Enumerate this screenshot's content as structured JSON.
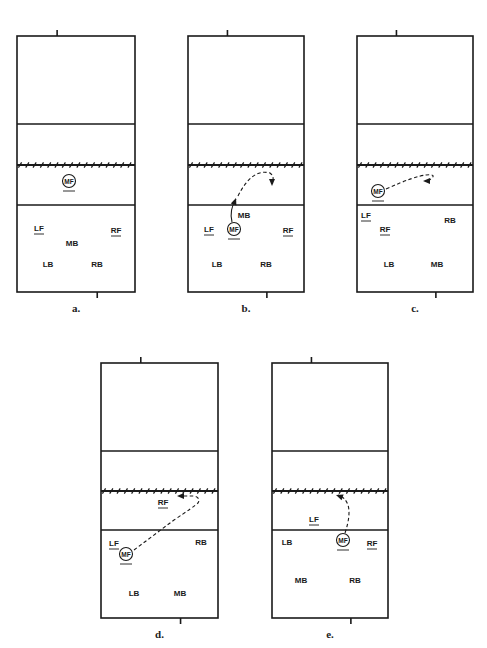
{
  "figure": {
    "ink_color": "#1a1a1a",
    "panels": [
      {
        "id": "a",
        "caption": "a.",
        "court": {
          "x": 17,
          "top": 36,
          "w": 118,
          "h": 256,
          "back_line_y": 124,
          "net_y": 165,
          "attack_line_y": 205
        },
        "players": [
          {
            "label": "MF",
            "x": 69,
            "y": 181,
            "circled": true,
            "underline": true
          },
          {
            "label": "LF",
            "x": 39,
            "y": 228,
            "underline": true
          },
          {
            "label": "MB",
            "x": 72,
            "y": 243
          },
          {
            "label": "RF",
            "x": 116,
            "y": 230,
            "underline": true
          },
          {
            "label": "LB",
            "x": 48,
            "y": 264
          },
          {
            "label": "RB",
            "x": 97,
            "y": 264
          }
        ],
        "paths": []
      },
      {
        "id": "b",
        "caption": "b.",
        "court": {
          "x": 188,
          "top": 36,
          "w": 116,
          "h": 256,
          "back_line_y": 124,
          "net_y": 165,
          "attack_line_y": 205
        },
        "players": [
          {
            "label": "MB",
            "x": 244,
            "y": 215
          },
          {
            "label": "LF",
            "x": 209,
            "y": 229,
            "underline": true
          },
          {
            "label": "MF",
            "x": 234,
            "y": 229,
            "circled": true,
            "underline": true
          },
          {
            "label": "RF",
            "x": 288,
            "y": 230,
            "underline": true
          },
          {
            "label": "LB",
            "x": 217,
            "y": 264
          },
          {
            "label": "RB",
            "x": 266,
            "y": 264
          }
        ],
        "paths": [
          {
            "style": "solid",
            "d": "M232 222 Q229 210 236 199",
            "arrow": {
              "x": 236,
              "y": 198,
              "angle": -70
            }
          },
          {
            "style": "dashed",
            "d": "M238 196 Q252 168 270 173 Q275 177 272 182",
            "arrow": {
              "x": 272,
              "y": 186,
              "angle": 90
            }
          }
        ]
      },
      {
        "id": "c",
        "caption": "c.",
        "court": {
          "x": 357,
          "top": 36,
          "w": 116,
          "h": 256,
          "back_line_y": 124,
          "net_y": 165,
          "attack_line_y": 205
        },
        "players": [
          {
            "label": "MF",
            "x": 378,
            "y": 191,
            "circled": true,
            "underline": true
          },
          {
            "label": "LF",
            "x": 366,
            "y": 215,
            "underline": true
          },
          {
            "label": "RB",
            "x": 450,
            "y": 220
          },
          {
            "label": "RF",
            "x": 385,
            "y": 229,
            "underline": true
          },
          {
            "label": "LB",
            "x": 389,
            "y": 264
          },
          {
            "label": "MB",
            "x": 437,
            "y": 264
          }
        ],
        "paths": [
          {
            "style": "dashed",
            "d": "M386 189 Q415 176 426 175 Q436 174 432 178 Q430 180 426 181",
            "arrow": {
              "x": 423,
              "y": 181,
              "angle": 180
            }
          }
        ]
      },
      {
        "id": "d",
        "caption": "d.",
        "court": {
          "x": 101,
          "top": 363,
          "w": 117,
          "h": 255,
          "back_line_y": 451,
          "net_y": 491,
          "attack_line_y": 530
        },
        "players": [
          {
            "label": "RF",
            "x": 163,
            "y": 502,
            "underline": true
          },
          {
            "label": "LF",
            "x": 114,
            "y": 543,
            "underline": true
          },
          {
            "label": "RB",
            "x": 201,
            "y": 542
          },
          {
            "label": "MF",
            "x": 126,
            "y": 554,
            "circled": true,
            "underline": true
          },
          {
            "label": "LB",
            "x": 134,
            "y": 593
          },
          {
            "label": "MB",
            "x": 180,
            "y": 593
          }
        ],
        "paths": [
          {
            "style": "dashed",
            "d": "M134 550 L174 520 Q195 506 198 503 Q201 498 194 496 L180 496",
            "arrow": {
              "x": 177,
              "y": 496,
              "angle": 180
            }
          }
        ]
      },
      {
        "id": "e",
        "caption": "e.",
        "court": {
          "x": 272,
          "top": 363,
          "w": 116,
          "h": 255,
          "back_line_y": 451,
          "net_y": 491,
          "attack_line_y": 530
        },
        "players": [
          {
            "label": "LF",
            "x": 314,
            "y": 519,
            "underline": true
          },
          {
            "label": "LB",
            "x": 287,
            "y": 542
          },
          {
            "label": "MF",
            "x": 343,
            "y": 540,
            "circled": true,
            "underline": true
          },
          {
            "label": "RF",
            "x": 372,
            "y": 543,
            "underline": true
          },
          {
            "label": "MB",
            "x": 301,
            "y": 580
          },
          {
            "label": "RB",
            "x": 355,
            "y": 580
          }
        ],
        "paths": [
          {
            "style": "dashed",
            "d": "M345 533 Q351 515 348 505 Q345 497 338 495",
            "arrow": {
              "x": 336,
              "y": 495,
              "angle": 200
            }
          }
        ]
      }
    ]
  }
}
